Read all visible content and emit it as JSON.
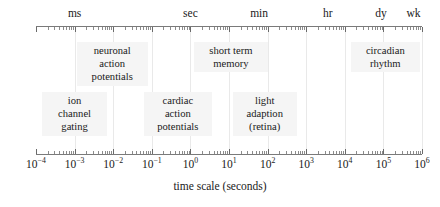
{
  "figure": {
    "caption": "time scale (seconds)",
    "axis": {
      "type": "log10",
      "left_px": 36,
      "right_px": 422,
      "exp_min": -4,
      "exp_max": 6,
      "decades": [
        {
          "exp": "-4",
          "label": "10",
          "sup": "−4"
        },
        {
          "exp": "-3",
          "label": "10",
          "sup": "−3"
        },
        {
          "exp": "-2",
          "label": "10",
          "sup": "−2"
        },
        {
          "exp": "-1",
          "label": "10",
          "sup": "−1"
        },
        {
          "exp": "0",
          "label": "10",
          "sup": "0"
        },
        {
          "exp": "1",
          "label": "10",
          "sup": "1"
        },
        {
          "exp": "2",
          "label": "10",
          "sup": "2"
        },
        {
          "exp": "3",
          "label": "10",
          "sup": "3"
        },
        {
          "exp": "4",
          "label": "10",
          "sup": "4"
        },
        {
          "exp": "5",
          "label": "10",
          "sup": "5"
        },
        {
          "exp": "6",
          "label": "10",
          "sup": "6"
        }
      ],
      "unit_markers": [
        {
          "label": "ms",
          "exp": -3.0
        },
        {
          "label": "sec",
          "exp": 0.0
        },
        {
          "label": "min",
          "exp": 1.78
        },
        {
          "label": "hr",
          "exp": 3.56
        },
        {
          "label": "dy",
          "exp": 4.94
        },
        {
          "label": "wk",
          "exp": 5.78
        }
      ]
    },
    "annotations": [
      {
        "id": "neuronal-action-potentials",
        "lines": [
          "neuronal",
          "action",
          "potentials"
        ],
        "exp_start": -2.95,
        "exp_end": -1.1,
        "row": "upper"
      },
      {
        "id": "ion-channel-gating",
        "lines": [
          "ion",
          "channel",
          "gating"
        ],
        "exp_start": -3.85,
        "exp_end": -2.15,
        "row": "lower"
      },
      {
        "id": "cardiac-action-potentials",
        "lines": [
          "cardiac",
          "action",
          "potentials"
        ],
        "exp_start": -1.2,
        "exp_end": 0.55,
        "row": "lower"
      },
      {
        "id": "short-term-memory",
        "lines": [
          "short term",
          "memory"
        ],
        "exp_start": 0.1,
        "exp_end": 2.0,
        "row": "upper"
      },
      {
        "id": "light-adaption-retina",
        "lines": [
          "light",
          "adaption",
          "(retina)"
        ],
        "exp_start": 1.1,
        "exp_end": 2.75,
        "row": "lower"
      },
      {
        "id": "circadian-rhythm",
        "lines": [
          "circadian",
          "rhythm"
        ],
        "exp_start": 4.15,
        "exp_end": 5.95,
        "row": "upper"
      }
    ]
  },
  "chart_data": {
    "type": "bar",
    "title": "",
    "subtitle": "",
    "xlabel": "time scale (seconds)",
    "ylabel": "",
    "scale": "log10",
    "xlim": [
      0.0001,
      1000000
    ],
    "xticklabels": [
      "10^-4",
      "10^-3",
      "10^-2",
      "10^-1",
      "10^0",
      "10^1",
      "10^2",
      "10^3",
      "10^4",
      "10^5",
      "10^6"
    ],
    "grid": true,
    "legend": "none",
    "secondary_axis_labels": [
      "ms",
      "sec",
      "min",
      "hr",
      "dy",
      "wk"
    ],
    "categories": [
      "ion channel gating",
      "neuronal action potentials",
      "cardiac action potentials",
      "short term memory",
      "light adaption (retina)",
      "circadian rhythm"
    ],
    "series": [
      {
        "name": "time scale span (seconds)",
        "spans": [
          {
            "label": "ion channel gating",
            "start": 0.00014,
            "end": 0.0071
          },
          {
            "label": "neuronal action potentials",
            "start": 0.0011,
            "end": 0.079
          },
          {
            "label": "cardiac action potentials",
            "start": 0.063,
            "end": 3.5
          },
          {
            "label": "short term memory",
            "start": 1.26,
            "end": 100
          },
          {
            "label": "light adaption (retina)",
            "start": 12.6,
            "end": 562
          },
          {
            "label": "circadian rhythm",
            "start": 14100,
            "end": 891000
          }
        ]
      }
    ]
  }
}
